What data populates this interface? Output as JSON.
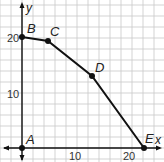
{
  "chart_data": {
    "type": "line",
    "title": "",
    "xlabel": "x",
    "ylabel": "y",
    "xlim": [
      -3,
      26
    ],
    "ylim": [
      -3,
      26
    ],
    "grid": true,
    "grid_step": 2,
    "x_ticks": [
      {
        "value": 10,
        "label": "10"
      },
      {
        "value": 20,
        "label": "20"
      }
    ],
    "y_ticks": [
      {
        "value": 10,
        "label": "10"
      },
      {
        "value": 20,
        "label": "20"
      }
    ],
    "series": [
      {
        "name": "path",
        "points": [
          {
            "label": "B",
            "x": 0,
            "y": 20
          },
          {
            "label": "C",
            "x": 5,
            "y": 19.4
          },
          {
            "label": "D",
            "x": 13,
            "y": 13
          },
          {
            "label": "E",
            "x": 22,
            "y": 0
          }
        ]
      }
    ],
    "annotations": [
      {
        "label": "A",
        "x": 0,
        "y": 0
      },
      {
        "label": "B",
        "x": 0,
        "y": 20
      },
      {
        "label": "C",
        "x": 5,
        "y": 19.4
      },
      {
        "label": "D",
        "x": 13,
        "y": 13
      },
      {
        "label": "E",
        "x": 22,
        "y": 0
      }
    ]
  },
  "labels": {
    "x_axis": "x",
    "y_axis": "y",
    "tick_x_10": "10",
    "tick_x_20": "20",
    "tick_y_10": "10",
    "tick_y_20": "20",
    "point_a": "A",
    "point_b": "B",
    "point_c": "C",
    "point_d": "D",
    "point_e": "E"
  },
  "colors": {
    "grid": "#c8c8c8",
    "axis": "#111111",
    "line": "#111111"
  }
}
